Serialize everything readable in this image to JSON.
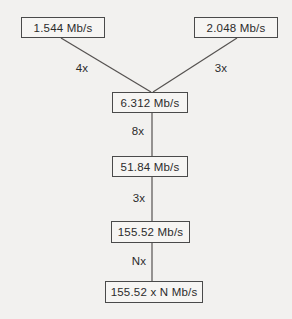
{
  "diagram": {
    "colors": {
      "background": "#f2f1ef",
      "box_border": "#4a4a4a",
      "box_fill": "#f6f5f3",
      "line": "#555250",
      "text": "#2b2b2b"
    },
    "nodes": [
      {
        "id": "node-1544",
        "label": "1.544 Mb/s"
      },
      {
        "id": "node-2048",
        "label": "2.048 Mb/s"
      },
      {
        "id": "node-6312",
        "label": "6.312 Mb/s"
      },
      {
        "id": "node-5184",
        "label": "51.84 Mb/s"
      },
      {
        "id": "node-15552",
        "label": "155.52 Mb/s"
      },
      {
        "id": "node-15552xn",
        "label": "155.52 x N Mb/s"
      }
    ],
    "edges": [
      {
        "from": "1.544 Mb/s",
        "to": "6.312 Mb/s",
        "label": "4x"
      },
      {
        "from": "2.048 Mb/s",
        "to": "6.312 Mb/s",
        "label": "3x"
      },
      {
        "from": "6.312 Mb/s",
        "to": "51.84 Mb/s",
        "label": "8x"
      },
      {
        "from": "51.84 Mb/s",
        "to": "155.52 Mb/s",
        "label": "3x"
      },
      {
        "from": "155.52 Mb/s",
        "to": "155.52 x N Mb/s",
        "label": "Nx"
      }
    ]
  }
}
